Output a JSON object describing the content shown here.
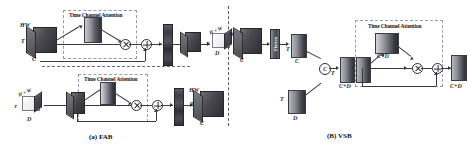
{
  "figure": {
    "panels": [
      {
        "id": "fab",
        "caption": "(a) FAB",
        "attention_title": "Time Channel Attention",
        "rows": [
          {
            "id": "fab-top",
            "input_labels": {
              "top": "HW",
              "left": "T",
              "bottom": "C"
            },
            "output_labels": {
              "top": "H × W",
              "left": "T",
              "bottom": "D"
            },
            "ops": [
              "multiply",
              "add"
            ]
          },
          {
            "id": "fab-bottom",
            "input_labels": {
              "top": "H × W",
              "left": "T",
              "bottom": "D"
            },
            "output_labels": {
              "top": "HW",
              "left": "T",
              "bottom": "C"
            },
            "ops": [
              "multiply",
              "add"
            ]
          }
        ]
      },
      {
        "id": "vsb",
        "caption": "(B) VSB",
        "attention_title": "Time Channel Attention",
        "flatten_label": "Flatten",
        "concat_symbol": "C",
        "labels": {
          "input_top": "W",
          "input_bottom": "C",
          "after_flatten_left": "T",
          "after_flatten_bottom": "C",
          "second_input_left": "T",
          "second_input_bottom": "D",
          "concat_out_left": "T",
          "concat_out_bottom": "C+D",
          "attention_map": "C+D",
          "output": "C+D"
        },
        "ops": [
          "multiply",
          "add"
        ]
      }
    ],
    "operators": {
      "multiply_icon": "otimes-icon",
      "add_icon": "oplus-icon",
      "concat_icon": "concat-circle-icon"
    },
    "colors": {
      "tensor_dark": "#3a3a40",
      "tensor_light": "#efefef",
      "line": "#3a3a42",
      "dashed_border": "#9a9aa6",
      "text": "#1c1c1c"
    }
  }
}
